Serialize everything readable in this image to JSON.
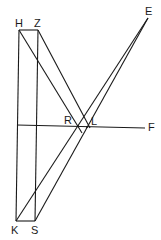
{
  "diagram": {
    "points": {
      "H": {
        "label": "H",
        "x": 19,
        "y": 30
      },
      "Z": {
        "label": "Z",
        "x": 38,
        "y": 30
      },
      "K": {
        "label": "K",
        "x": 16,
        "y": 221
      },
      "S": {
        "label": "S",
        "x": 35,
        "y": 221
      },
      "E": {
        "label": "E",
        "x": 148,
        "y": 18
      },
      "R": {
        "label": "R",
        "x": 78,
        "y": 126
      },
      "L": {
        "label": "L",
        "x": 87,
        "y": 127
      },
      "F": {
        "label": "F",
        "x": 145,
        "y": 128
      }
    },
    "labels": {
      "H": "H",
      "Z": "Z",
      "K": "K",
      "S": "S",
      "E": "E",
      "R": "R",
      "L": "L",
      "F": "F"
    },
    "stroke_color": "#1a1a1a"
  }
}
